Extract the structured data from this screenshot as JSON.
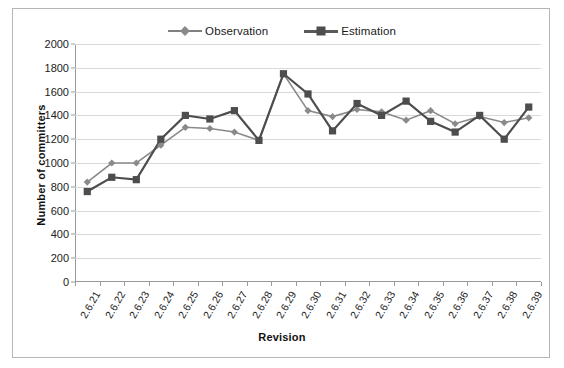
{
  "chart_data": {
    "type": "line",
    "title": "",
    "xlabel": "Revision",
    "ylabel": "Number of committers",
    "ylim": [
      0,
      2000
    ],
    "ytick_step": 200,
    "grid": true,
    "legend_position": "top-center",
    "categories": [
      "2.6.21",
      "2.6.22",
      "2.6.23",
      "2.6.24",
      "2.6.25",
      "2.6.26",
      "2.6.27",
      "2.6.28",
      "2.6.29",
      "2.6.30",
      "2.6.31",
      "2.6.32",
      "2.6.33",
      "2.6.34",
      "2.6.35",
      "2.6.36",
      "2.6.37",
      "2.6.38",
      "2.6.39"
    ],
    "yticks": [
      "0",
      "200",
      "400",
      "600",
      "800",
      "1000",
      "1200",
      "1400",
      "1600",
      "1800",
      "2000"
    ],
    "series": [
      {
        "name": "Observation",
        "color": "#8a8a8a",
        "marker": "diamond",
        "values": [
          840,
          1000,
          1000,
          1150,
          1300,
          1290,
          1260,
          1190,
          1750,
          1440,
          1390,
          1450,
          1430,
          1360,
          1440,
          1330,
          1390,
          1340,
          1380
        ]
      },
      {
        "name": "Estimation",
        "color": "#4d4d4d",
        "marker": "square",
        "values": [
          760,
          880,
          860,
          1200,
          1400,
          1370,
          1440,
          1190,
          1750,
          1580,
          1270,
          1500,
          1400,
          1520,
          1350,
          1260,
          1400,
          1200,
          1470
        ]
      }
    ]
  },
  "legend": {
    "observation_label": "Observation",
    "estimation_label": "Estimation"
  },
  "axes": {
    "x_title": "Revision",
    "y_title": "Number of committers"
  }
}
